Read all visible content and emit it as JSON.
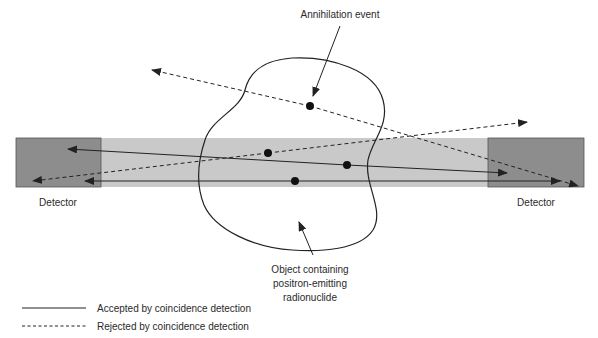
{
  "labels": {
    "annihilation_event": "Annihilation event",
    "detector_left": "Detector",
    "detector_right": "Detector",
    "object_line1": "Object containing",
    "object_line2": "positron-emitting",
    "object_line3": "radionuclide"
  },
  "legend": {
    "accepted": "Accepted by coincidence detection",
    "rejected": "Rejected by coincidence detection"
  },
  "colors": {
    "band": "#c9c9c9",
    "detector": "#8d8d8d",
    "line": "#222222"
  },
  "lines": [
    {
      "type": "rejected",
      "from": [
        152,
        70
      ],
      "to": [
        578,
        186
      ],
      "event": [
        310,
        106
      ]
    },
    {
      "type": "rejected",
      "from": [
        33,
        181
      ],
      "to": [
        527,
        122
      ],
      "event": [
        268,
        153
      ]
    },
    {
      "type": "accepted",
      "from": [
        68,
        149
      ],
      "to": [
        507,
        173
      ],
      "event": [
        347,
        165
      ]
    },
    {
      "type": "accepted",
      "from": [
        85,
        181
      ],
      "to": [
        560,
        181
      ],
      "event": [
        295,
        181
      ]
    }
  ]
}
